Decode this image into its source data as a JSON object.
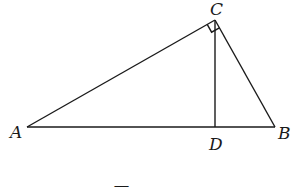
{
  "figure": {
    "type": "geometry-right-triangle",
    "points": {
      "A": {
        "label": "A",
        "x": 27,
        "y": 127
      },
      "B": {
        "label": "B",
        "x": 275,
        "y": 127
      },
      "C": {
        "label": "C",
        "x": 215,
        "y": 20
      },
      "D": {
        "label": "D",
        "x": 215,
        "y": 127
      }
    },
    "segments": [
      {
        "from": "A",
        "to": "B"
      },
      {
        "from": "A",
        "to": "C"
      },
      {
        "from": "B",
        "to": "C"
      },
      {
        "from": "C",
        "to": "D"
      }
    ],
    "right_angle_at": "C",
    "caption": "图"
  },
  "colors": {
    "stroke": "#1a1a1a",
    "background": "#ffffff"
  }
}
